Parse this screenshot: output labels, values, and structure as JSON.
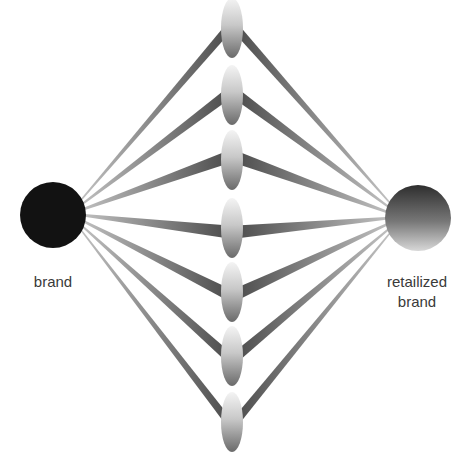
{
  "diagram": {
    "source_node": {
      "label": "brand",
      "cx": 53,
      "cy": 215,
      "r": 33,
      "color": "#121212"
    },
    "target_node": {
      "label": "retailized brand",
      "label_lines": [
        "retailized",
        "brand"
      ],
      "cx": 418,
      "cy": 218,
      "r": 33,
      "color_top": "#2e2e2e",
      "color_bottom": "#d8d8d8"
    },
    "intermediate_nodes": [
      {
        "cx": 232,
        "cy": 28,
        "rx": 11,
        "ry": 30
      },
      {
        "cx": 232,
        "cy": 95,
        "rx": 11,
        "ry": 30
      },
      {
        "cx": 232,
        "cy": 160,
        "rx": 11,
        "ry": 30
      },
      {
        "cx": 232,
        "cy": 228,
        "rx": 11,
        "ry": 30
      },
      {
        "cx": 232,
        "cy": 292,
        "rx": 11,
        "ry": 30
      },
      {
        "cx": 232,
        "cy": 356,
        "rx": 11,
        "ry": 30
      },
      {
        "cx": 232,
        "cy": 422,
        "rx": 11,
        "ry": 30
      }
    ],
    "band_color_near": "#4a4a4a",
    "band_color_far": "#d6d6d6",
    "node_color_light": "#f4f4f4",
    "node_color_dark": "#6a6a6a"
  }
}
